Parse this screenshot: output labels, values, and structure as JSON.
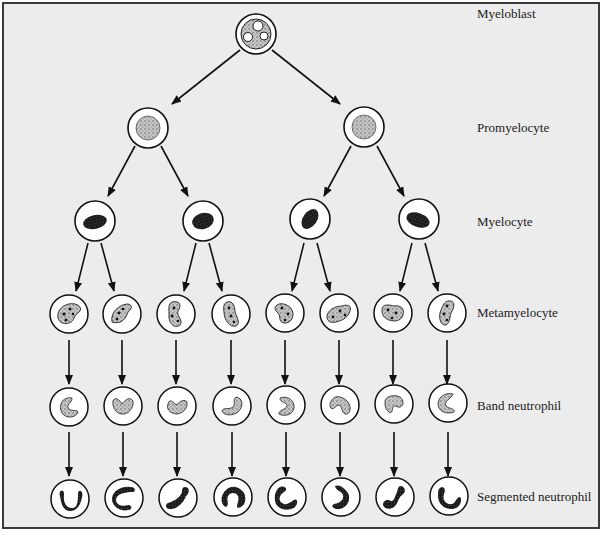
{
  "diagram": {
    "stages": [
      {
        "label": "Myeloblast",
        "y": 14,
        "count": 1
      },
      {
        "label": "Promyelocyte",
        "y": 128,
        "count": 2
      },
      {
        "label": "Myelocyte",
        "y": 222,
        "count": 4
      },
      {
        "label": "Metamyelocyte",
        "y": 313,
        "count": 8
      },
      {
        "label": "Band neutrophil",
        "y": 406,
        "count": 8
      },
      {
        "label": "Segmented neutrophil",
        "y": 497,
        "count": 8
      }
    ],
    "colors": {
      "background": "#ececec",
      "frame": "#3a3a3a",
      "cell_outline": "#1a1a1a",
      "cell_fill": "#ffffff",
      "stipple": "#9a9a9a",
      "dark_nucleus": "#1e1e1e"
    }
  }
}
